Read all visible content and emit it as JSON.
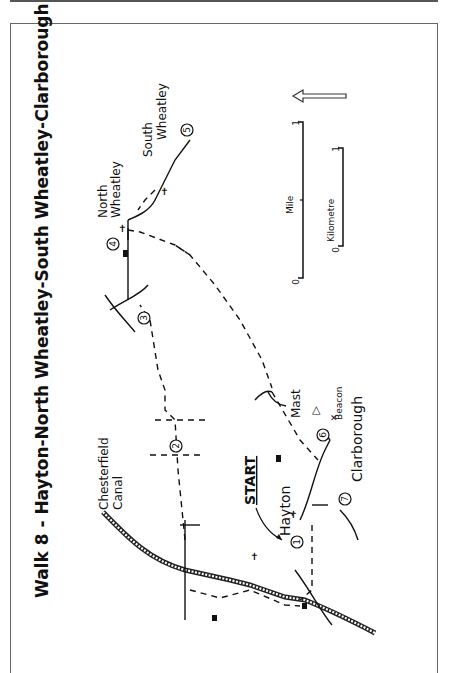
{
  "title": "Walk 8 - Hayton-North Wheatley-South Wheatley-Clarborough",
  "orientation": {
    "text_rotation_deg": -90,
    "north_arrow_icon": "north-arrow-icon"
  },
  "labels": {
    "start": "START",
    "hayton": "Hayton",
    "canal_line1": "Chesterfield",
    "canal_line2": "Canal",
    "north_wheatley_line1": "North",
    "north_wheatley_line2": "Wheatley",
    "south_wheatley_line1": "South",
    "south_wheatley_line2": "Wheatley",
    "clarborough": "Clarborough",
    "mast": "Mast",
    "beacon": "Beacon"
  },
  "waypoints": [
    "1",
    "2",
    "3",
    "4",
    "5",
    "6",
    "7"
  ],
  "scale": {
    "mile_label": "Mile",
    "mile_start": "0",
    "mile_end": "1",
    "km_label": "Kilometre",
    "km_start": "0",
    "km_end": "1"
  },
  "colors": {
    "ink": "#111111",
    "frame": "#666666",
    "background": "#ffffff"
  }
}
